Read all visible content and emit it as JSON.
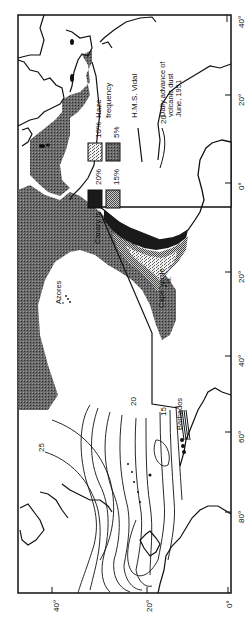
{
  "map": {
    "title": "Haze frequency and volcanic dust advance, June 1951",
    "orientation": "rotated 90 degrees (text reads bottom-to-top)",
    "colors": {
      "ink": "#111111",
      "paper": "#ffffff",
      "haze_20": "#1a1a1a",
      "haze_15": "#8a8a8a",
      "haze_10": "#d8d8d8",
      "haze_5": "#5a5a5a"
    },
    "legend": {
      "title_line1": "Haze",
      "title_line2": "frequency",
      "items": [
        {
          "label": "20%",
          "swatch": "haze_20"
        },
        {
          "label": "15%",
          "swatch": "haze_15"
        },
        {
          "label": "10%",
          "swatch": "haze_10"
        },
        {
          "label": "5%",
          "swatch": "haze_5"
        }
      ],
      "ship_track_label": "H.M.S. Vidal",
      "dust_label_value": "20",
      "dust_label_line1": "Daily advance of",
      "dust_label_line2": "volcanic dust",
      "dust_label_line3": "June, 1951"
    },
    "place_labels": {
      "azores": "Azores",
      "canary": "Canary Is.",
      "cape_verde": "Cape Verde",
      "cape_verde_is": "Is.",
      "barbados": "Barbados"
    },
    "contour_labels": {
      "c25": "25",
      "c20": "20",
      "c15": "15"
    },
    "axis_left": {
      "ticks": [
        "40°",
        "20°",
        "0°"
      ]
    },
    "axis_right": {
      "ticks": [
        "40°",
        "20°",
        "0°",
        "20°",
        "40°",
        "60°",
        "80°",
        "0°"
      ]
    }
  }
}
